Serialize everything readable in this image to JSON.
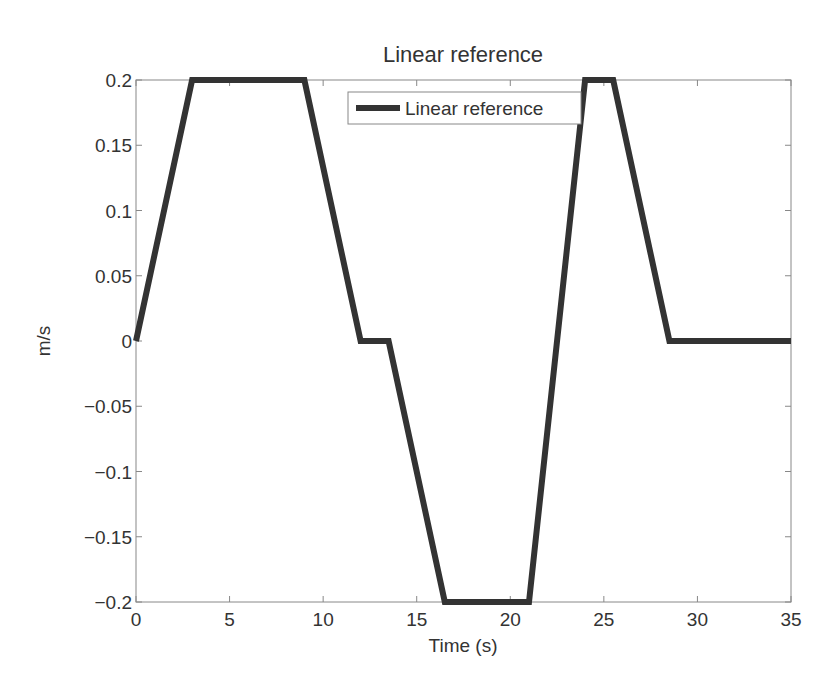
{
  "chart_data": {
    "type": "line",
    "title": "Linear reference",
    "xlabel": "Time (s)",
    "ylabel": "m/s",
    "xlim": [
      0,
      35
    ],
    "ylim": [
      -0.2,
      0.2
    ],
    "xticks": [
      0,
      5,
      10,
      15,
      20,
      25,
      30,
      35
    ],
    "xtick_labels": [
      "0",
      "5",
      "10",
      "15",
      "20",
      "25",
      "30",
      "35"
    ],
    "yticks": [
      0.2,
      0.15,
      0.1,
      0.05,
      0,
      -0.05,
      -0.1,
      -0.15,
      -0.2
    ],
    "ytick_labels": [
      "0.2",
      "0.15",
      "0.1",
      "0.05",
      "0",
      "−0.05",
      "−0.1",
      "−0.15",
      "−0.2"
    ],
    "grid": false,
    "legend_position": "upper center-right",
    "series": [
      {
        "name": "Linear reference",
        "color": "#333333",
        "x": [
          0,
          3,
          9,
          12,
          13.5,
          16.5,
          21,
          24,
          25.5,
          28.5,
          35
        ],
        "y": [
          0,
          0.2,
          0.2,
          0,
          0,
          -0.2,
          -0.2,
          0.2,
          0.2,
          0,
          0
        ]
      }
    ]
  },
  "legend": {
    "entries": [
      "Linear reference"
    ]
  }
}
